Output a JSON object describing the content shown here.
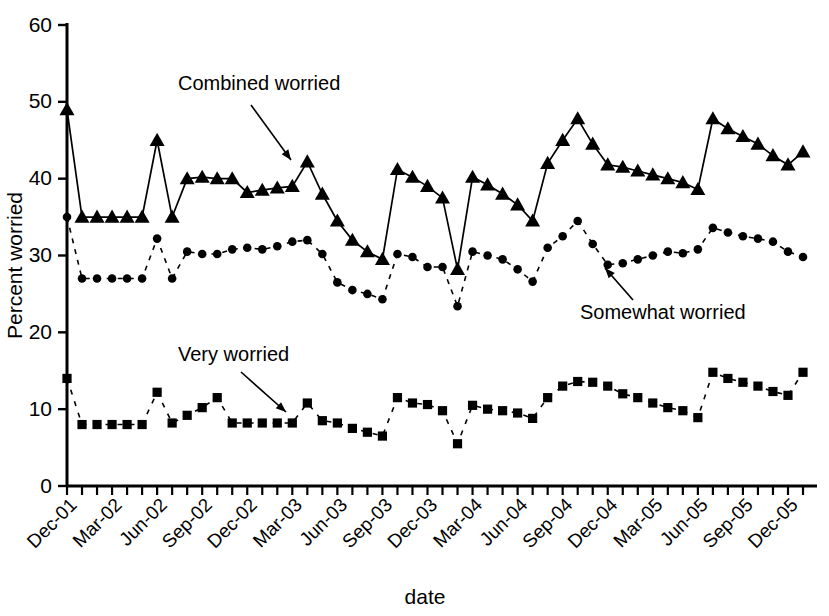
{
  "chart_data": {
    "type": "line",
    "title": "",
    "xlabel": "date",
    "ylabel": "Percent worried",
    "ylim": [
      0,
      60
    ],
    "yticks": [
      0,
      10,
      20,
      30,
      40,
      50,
      60
    ],
    "grid": false,
    "legend_position": "inline-annotations",
    "tick_labels": [
      "Dec-01",
      "Mar-02",
      "Jun-02",
      "Sep-02",
      "Dec-02",
      "Mar-03",
      "Jun-03",
      "Sep-03",
      "Dec-03",
      "Mar-04",
      "Jun-04",
      "Sep-04",
      "Dec-04",
      "Mar-05",
      "Jun-05",
      "Sep-05",
      "Dec-05"
    ],
    "annotations": [
      {
        "text": "Combined worried",
        "marker": "triangle"
      },
      {
        "text": "Somewhat worried",
        "marker": "circle"
      },
      {
        "text": "Very worried",
        "marker": "square"
      }
    ],
    "x": [
      "Nov-01",
      "Dec-01",
      "Jan-02",
      "Feb-02",
      "Mar-02",
      "Apr-02",
      "May-02",
      "Jun-02",
      "Jul-02",
      "Aug-02",
      "Sep-02",
      "Oct-02",
      "Nov-02",
      "Dec-02",
      "Jan-03",
      "Feb-03",
      "Mar-03",
      "Apr-03",
      "May-03",
      "Jun-03",
      "Jul-03",
      "Aug-03",
      "Sep-03",
      "Oct-03",
      "Nov-03",
      "Dec-03",
      "Jan-04",
      "Feb-04",
      "Mar-04",
      "Apr-04",
      "May-04",
      "Jun-04",
      "Jul-04",
      "Aug-04",
      "Sep-04",
      "Oct-04",
      "Nov-04",
      "Dec-04",
      "Jan-05",
      "Feb-05",
      "Mar-05",
      "Apr-05",
      "May-05",
      "Jun-05",
      "Jul-05",
      "Aug-05",
      "Sep-05",
      "Oct-05",
      "Nov-05",
      "Dec-05"
    ],
    "series": [
      {
        "name": "Combined worried",
        "marker": "triangle",
        "linestyle": "solid",
        "values": [
          49.0,
          35.0,
          35.0,
          35.0,
          35.0,
          35.0,
          45.0,
          35.0,
          40.0,
          40.2,
          40.0,
          40.0,
          38.2,
          38.5,
          38.8,
          39.0,
          42.2,
          38.0,
          34.5,
          32.0,
          30.5,
          29.5,
          41.2,
          40.2,
          39.0,
          37.5,
          28.2,
          40.2,
          39.2,
          38.0,
          36.6,
          34.5,
          42.0,
          45.0,
          47.8,
          44.5,
          41.8,
          41.5,
          41.0,
          40.5,
          40.0,
          39.5,
          38.6,
          47.8,
          46.5,
          45.5,
          44.5,
          43.0,
          41.8,
          43.5
        ]
      },
      {
        "name": "Somewhat worried",
        "marker": "circle",
        "linestyle": "dashed",
        "values": [
          35.0,
          27.0,
          27.0,
          27.0,
          27.0,
          27.0,
          32.2,
          27.0,
          30.5,
          30.2,
          30.2,
          30.8,
          31.0,
          30.8,
          31.2,
          31.8,
          32.0,
          30.2,
          26.5,
          25.5,
          25.0,
          24.3,
          30.2,
          29.8,
          28.5,
          28.5,
          23.4,
          30.5,
          30.0,
          29.5,
          28.2,
          26.6,
          31.0,
          32.5,
          34.5,
          31.5,
          28.8,
          29.0,
          29.5,
          30.0,
          30.5,
          30.3,
          30.8,
          33.6,
          33.0,
          32.5,
          32.2,
          31.8,
          30.5,
          29.8
        ]
      },
      {
        "name": "Very worried",
        "marker": "square",
        "linestyle": "dashed",
        "values": [
          14.0,
          8.0,
          8.0,
          8.0,
          8.0,
          8.0,
          12.2,
          8.2,
          9.2,
          10.2,
          11.5,
          8.2,
          8.2,
          8.2,
          8.2,
          8.2,
          10.8,
          8.5,
          8.2,
          7.5,
          7.0,
          6.5,
          11.5,
          10.8,
          10.6,
          9.8,
          5.5,
          10.5,
          10.0,
          9.8,
          9.5,
          8.8,
          11.5,
          13.0,
          13.6,
          13.5,
          13.0,
          12.0,
          11.5,
          10.8,
          10.2,
          9.8,
          8.9,
          14.8,
          14.0,
          13.5,
          13.0,
          12.3,
          11.8,
          14.8
        ]
      }
    ]
  }
}
